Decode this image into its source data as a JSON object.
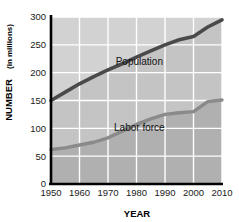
{
  "chart_data": {
    "type": "area",
    "title": "",
    "xlabel": "YEAR",
    "ylabel": "NUMBER (in millions)",
    "ylabel_main": "NUMBER",
    "ylabel_unit": "(in millions)",
    "x": [
      1950,
      1960,
      1970,
      1980,
      1990,
      2000,
      2010
    ],
    "xlim": [
      1950,
      2010
    ],
    "ylim": [
      0,
      300
    ],
    "yticks": [
      0,
      50,
      100,
      150,
      200,
      250,
      300
    ],
    "ytick_labels": [
      "0",
      "50",
      "100",
      "150",
      "200",
      "250",
      "300"
    ],
    "xticks": [
      1950,
      1960,
      1970,
      1980,
      1990,
      2000,
      2010
    ],
    "xtick_labels": [
      "1950",
      "1960",
      "1970",
      "1980",
      "1990",
      "2000",
      "2010"
    ],
    "grid": true,
    "legend_position": "inline-annotation",
    "series": [
      {
        "name": "Population",
        "label": "Population",
        "color": "#4a4a4a",
        "x": [
          1950,
          1955,
          1960,
          1965,
          1970,
          1975,
          1980,
          1985,
          1990,
          1995,
          2000,
          2005,
          2010
        ],
        "values": [
          150,
          165,
          180,
          193,
          205,
          216,
          228,
          239,
          250,
          259,
          265,
          282,
          295
        ]
      },
      {
        "name": "Labor force",
        "label": "Labor force",
        "color": "#8a8a8a",
        "x": [
          1950,
          1955,
          1960,
          1965,
          1970,
          1975,
          1980,
          1985,
          1990,
          1995,
          2000,
          2005,
          2010
        ],
        "values": [
          62,
          65,
          70,
          75,
          83,
          95,
          107,
          117,
          125,
          128,
          130,
          148,
          151
        ]
      }
    ],
    "annotations": [
      {
        "text": "Population",
        "x": 1981,
        "y": 213
      },
      {
        "text": "Labor force",
        "x": 1981,
        "y": 95
      }
    ],
    "colors": {
      "band_upper": "#d2d2d2",
      "band_middle": "#c4c4c4",
      "band_lower": "#b0b0b0",
      "gridline": "#ffffff",
      "axis": "#000000",
      "population_line": "#4a4a4a",
      "labor_line": "#8a8a8a",
      "text": "#000000",
      "background": "#ffffff"
    }
  }
}
